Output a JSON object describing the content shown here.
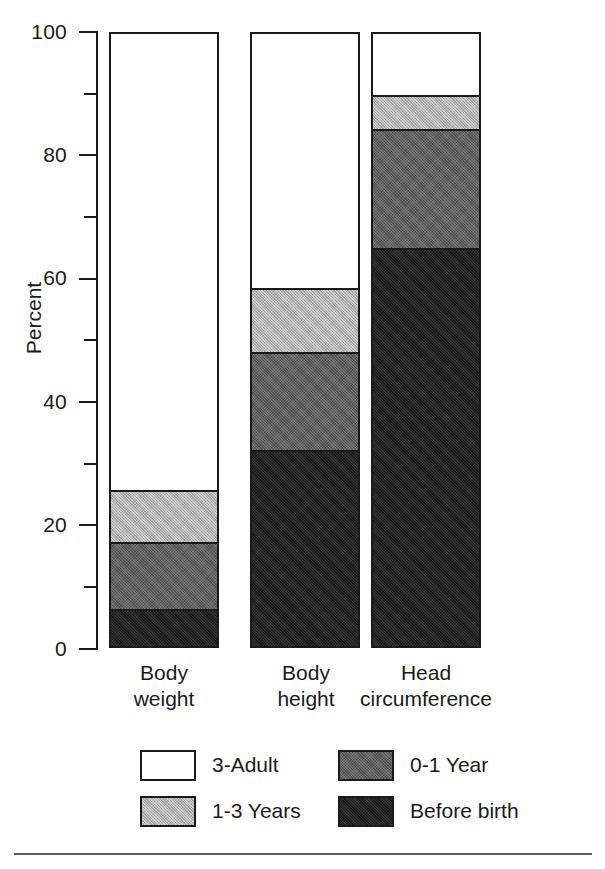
{
  "chart_data": {
    "type": "bar",
    "subtype": "stacked-bar-100",
    "title": "",
    "xlabel": "",
    "ylabel": "Percent",
    "ylim": [
      0,
      100
    ],
    "ytick_major": [
      0,
      20,
      40,
      60,
      80,
      100
    ],
    "ytick_minor": [
      10,
      30,
      50,
      70,
      90
    ],
    "grid": false,
    "legend_position": "bottom",
    "categories": [
      "Body weight",
      "Body height",
      "Head circumference"
    ],
    "category_lines": [
      [
        "Body",
        "weight"
      ],
      [
        "Body",
        "height"
      ],
      [
        "Head",
        "circumference"
      ]
    ],
    "series": [
      {
        "name": "Before birth",
        "color": "#1f1f1f",
        "values": [
          6,
          32,
          65
        ]
      },
      {
        "name": "0-1 Year",
        "color": "#5e5e5e",
        "values": [
          11,
          16,
          19.5
        ]
      },
      {
        "name": "1-3 Years",
        "color": "#b0b0b0",
        "values": [
          8.5,
          10.5,
          5.5
        ]
      },
      {
        "name": "3-Adult",
        "color": "#ffffff",
        "values": [
          74.5,
          41.5,
          10
        ]
      }
    ],
    "cumulative_tops": {
      "Before birth": [
        6,
        32,
        65
      ],
      "0-1 Year": [
        17,
        48,
        84.5
      ],
      "1-3 Years": [
        25.5,
        58.5,
        90
      ],
      "3-Adult": [
        100,
        100,
        100
      ]
    }
  },
  "axis": {
    "y_title": "Percent",
    "tick_labels": [
      "100",
      "80",
      "60",
      "40",
      "20",
      "0"
    ]
  },
  "legend": {
    "entries": [
      {
        "label": "3-Adult",
        "swatch": "white-swatch"
      },
      {
        "label": "0-1 Year",
        "swatch": "dark-gray-swatch"
      },
      {
        "label": "1-3 Years",
        "swatch": "light-gray-swatch"
      },
      {
        "label": "Before birth",
        "swatch": "black-swatch"
      }
    ]
  }
}
